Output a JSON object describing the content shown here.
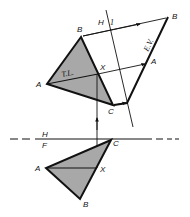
{
  "diagram": {
    "colors": {
      "line": "#111111",
      "fill": "#a8a8a8",
      "background": "#ffffff"
    },
    "top_view": {
      "labels": {
        "A": "A",
        "B": "B",
        "C": "C",
        "X": "X",
        "true_length": "T.L."
      }
    },
    "front_view": {
      "labels": {
        "A": "A",
        "B": "B",
        "C": "C",
        "X": "X"
      }
    },
    "auxiliary_view": {
      "labels": {
        "A": "A",
        "B": "B",
        "edge_view": "E.V."
      }
    },
    "fold_lines": {
      "hf": {
        "upper": "H",
        "lower": "F"
      },
      "h1": {
        "left": "H",
        "right": "1"
      }
    }
  }
}
